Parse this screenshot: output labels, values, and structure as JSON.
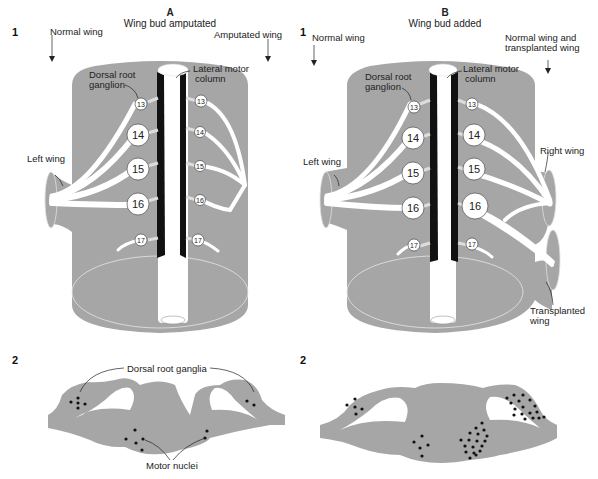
{
  "colors": {
    "tissue": "#a6a6a6",
    "nerve": "#ffffff",
    "motor_column": "#111111",
    "text": "#222222",
    "background": "#ffffff"
  },
  "panel_a": {
    "letter": "A",
    "title": "Wing bud amputated",
    "row1_number": "1",
    "row2_number": "2",
    "labels": {
      "normal_wing": "Normal wing",
      "amputated_wing": "Amputated wing",
      "dorsal_root_ganglion_line1": "Dorsal root",
      "dorsal_root_ganglion_line2": "ganglion",
      "lateral_motor_column_line1": "Lateral motor",
      "lateral_motor_column_line2": "column",
      "left_wing": "Left wing",
      "dorsal_root_ganglia": "Dorsal root ganglia",
      "motor_nuclei": "Motor nuclei"
    },
    "ganglia_left": [
      "13",
      "14",
      "15",
      "16",
      "17"
    ],
    "ganglia_right": [
      "13",
      "14",
      "15",
      "16",
      "17"
    ]
  },
  "panel_b": {
    "letter": "B",
    "title": "Wing bud added",
    "row1_number": "1",
    "row2_number": "2",
    "labels": {
      "normal_wing": "Normal wing",
      "normal_and_transplanted_line1": "Normal wing and",
      "normal_and_transplanted_line2": "transplanted wing",
      "dorsal_root_ganglion_line1": "Dorsal root",
      "dorsal_root_ganglion_line2": "ganglion",
      "lateral_motor_column_line1": "Lateral motor",
      "lateral_motor_column_line2": "column",
      "left_wing": "Left wing",
      "right_wing": "Right wing",
      "transplanted_wing_line1": "Transplanted",
      "transplanted_wing_line2": "wing"
    },
    "ganglia_left": [
      "13",
      "14",
      "15",
      "16",
      "17"
    ],
    "ganglia_right": [
      "13",
      "14",
      "15",
      "16",
      "17"
    ]
  }
}
